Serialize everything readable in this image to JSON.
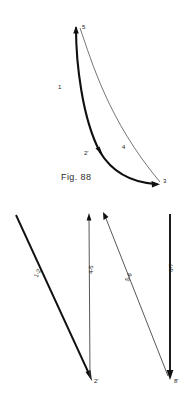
{
  "document": {
    "kind": "textbook-figure-plate",
    "background_color": "#ffffff",
    "ink_color": "#1a1a1a"
  },
  "figures": [
    {
      "id": "fig-88",
      "caption": "Fig. 88",
      "description": "Two curves springing from a common upper point and meeting again at a lower right point, forming a closed lens-shaped loop.",
      "point_labels": [
        {
          "name": "point-5",
          "text": "5"
        },
        {
          "name": "point-2-prime",
          "text": "2'"
        },
        {
          "name": "point-3",
          "text": "3"
        }
      ],
      "segment_labels": [
        {
          "name": "segment-1",
          "text": "1"
        },
        {
          "name": "segment-4",
          "text": "4"
        }
      ],
      "curves": [
        {
          "name": "thick-curve",
          "weight": "heavy",
          "from": "5",
          "via": "2'",
          "to": "3"
        },
        {
          "name": "thin-curve",
          "weight": "light",
          "from": "5",
          "to": "3"
        }
      ]
    },
    {
      "id": "fig-89",
      "caption": "Fig. 89",
      "description": "Four straight arrows, two oblique and two vertical, annotated with process interval labels rotated along each shaft.",
      "arrows": [
        {
          "name": "arrow-1-2",
          "label": "1-2",
          "weight": "heavy",
          "orientation": "oblique-down-right"
        },
        {
          "name": "arrow-4-5",
          "label": "4-5",
          "weight": "light",
          "orientation": "vertical-up"
        },
        {
          "name": "arrow-5-6",
          "label": "5-6",
          "weight": "light",
          "orientation": "oblique-down-right"
        },
        {
          "name": "arrow-6-7",
          "label": "6-7",
          "weight": "heavy",
          "orientation": "vertical-down"
        }
      ],
      "point_labels": [
        {
          "name": "point-2-prime",
          "text": "2'"
        },
        {
          "name": "point-8-prime",
          "text": "8'"
        }
      ]
    }
  ]
}
